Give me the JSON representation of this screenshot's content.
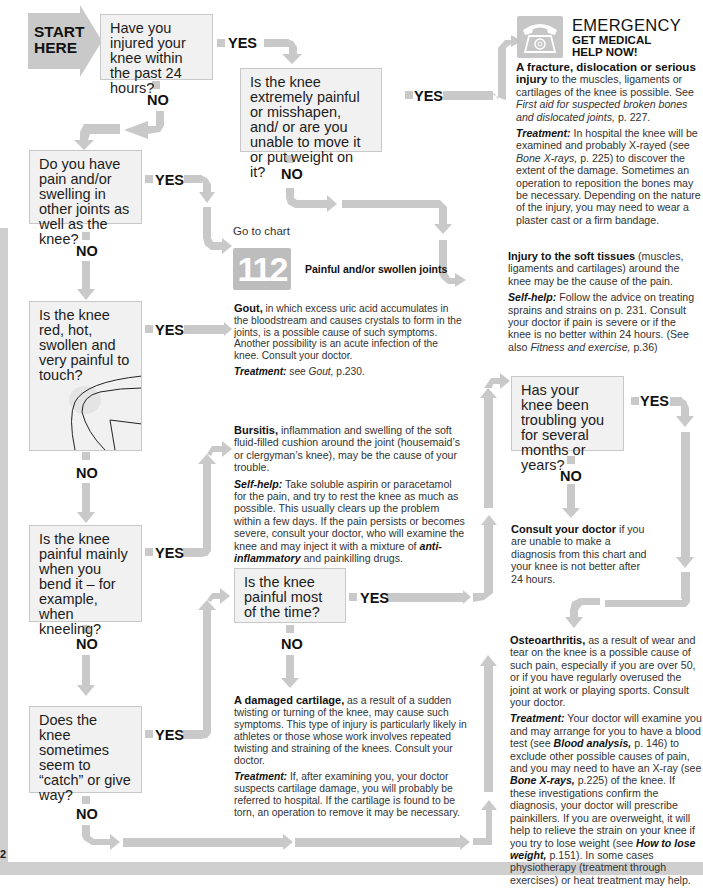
{
  "start": {
    "label_line1": "START",
    "label_line2": "HERE"
  },
  "questions": {
    "q1": "Have you injured your knee within the past 24 hours?",
    "q2": "Is the knee extremely painful or misshapen, and/ or are you unable to move it or put weight on it?",
    "q3": "Do you have pain and/or swelling in other joints as well as the knee?",
    "q4": "Is the knee red, hot, swollen and very painful to touch?",
    "q5": "Is the knee painful mainly when you bend it – for example, when kneeling?",
    "q6": "Is the knee painful most of the time?",
    "q7": "Does the knee sometimes seem to “catch” or give way?",
    "q8": "Has your knee been troubling you for several months or years?"
  },
  "labels": {
    "yes": "YES",
    "no": "NO"
  },
  "emergency": {
    "icon": "telephone-icon",
    "title": "EMERGENCY",
    "subtitle_line1": "GET MEDICAL",
    "subtitle_line2": "HELP NOW!",
    "bold": "A fracture, dislocation or serious injury",
    "text": " to the muscles, ligaments or cartilages of the knee is possible. See ",
    "ref": "First aid for suspected broken bones and dislocated joints,",
    "ref_page": " p. 227.",
    "treatment_label": "Treatment:",
    "treatment_a": " In hospital the knee will be examined and probably X-rayed (see ",
    "treatment_ref": "Bone X-rays,",
    "treatment_b": " p. 225) to discover the extent of the damage. Sometimes an operation to reposition the bones may be necessary. Depending on the nature of the injury, you may need to wear a plaster cast or a firm bandage."
  },
  "soft_tissue": {
    "bold": "Injury to the soft tissues",
    "text": " (muscles, ligaments and cartilages) around the knee may be the cause of the pain.",
    "selfhelp_label": "Self-help:",
    "selfhelp_a": " Follow the advice on treating sprains and strains on p. 231. Consult your doctor if pain is severe or if the knee is no better within 24 hours. (See also ",
    "selfhelp_ref": "Fitness and exercise,",
    "selfhelp_b": " p.36)"
  },
  "goto_chart": {
    "prefix": "Go to chart",
    "number": "112",
    "title": "Painful and/or swollen joints"
  },
  "gout": {
    "bold": "Gout,",
    "text": " in which excess uric acid accumulates in the bloodstream and causes crystals to form in the joints, is a possible cause of such symptoms. Another possibility is an acute infection of the knee. Consult your doctor.",
    "treatment_label": "Treatment:",
    "treatment_a": " see ",
    "treatment_ref": "Gout,",
    "treatment_b": " p.230."
  },
  "bursitis": {
    "bold": "Bursitis,",
    "text": " inflammation and swelling of the soft fluid-filled cushion around the joint (housemaid’s or clergyman’s knee), may be the cause of your trouble.",
    "selfhelp_label": "Self-help:",
    "selfhelp_a": " Take soluble aspirin or paracetamol for the pain, and try to rest the knee as much as possible. This usually clears up the problem within a few days. If the pain persists or becomes severe, consult your doctor, who will examine the knee and may inject it with a mixture of ",
    "selfhelp_ref": "anti-inflammatory",
    "selfhelp_b": " and painkilling drugs."
  },
  "cartilage": {
    "bold": "A damaged cartilage,",
    "text": " as a result of a sudden twisting or turning of the knee, may cause such symptoms. This type of injury is particularly likely in athletes or those whose work involves repeated twisting and straining of the knees. Consult your doctor.",
    "treatment_label": "Treatment:",
    "treatment_text": " If, after examining you, your doctor suspects cartilage damage, you will probably be referred to hospital. If the cartilage is found to be torn, an operation to remove it may be necessary."
  },
  "consult": {
    "bold": "Consult your doctor",
    "text": " if you are unable to make a diagnosis from this chart and your knee is not better after 24 hours."
  },
  "osteo": {
    "bold": "Osteoarthritis,",
    "text": " as a result of wear and tear on the knee is a possible cause of such pain, especially if you are over 50, or if you have regularly overused the joint at work or playing sports. Consult your doctor.",
    "treatment_label": "Treatment:",
    "t1": " Your doctor will examine you and may arrange for you to have a blood test (see ",
    "ref1": "Blood analysis,",
    "t2": " p. 146) to exclude other possible causes of pain, and you may need to have an X-ray (see ",
    "ref2": "Bone X-rays,",
    "t3": " p.225) of the knee. If these investigations confirm the diagnosis, your doctor will prescribe painkillers. If you are overweight, it will help to relieve the strain on your knee if you try to lose weight (see ",
    "ref3": "How to lose weight,",
    "t4": " p.151). In some cases physiotherapy (treatment through exercises) or heat treatment may help."
  },
  "page_number": "2",
  "colors": {
    "arrow": "#c9c9c9",
    "box_bg": "#f1f1f1",
    "box_border": "#c8c8c8",
    "strip": "#cfcfcf"
  }
}
